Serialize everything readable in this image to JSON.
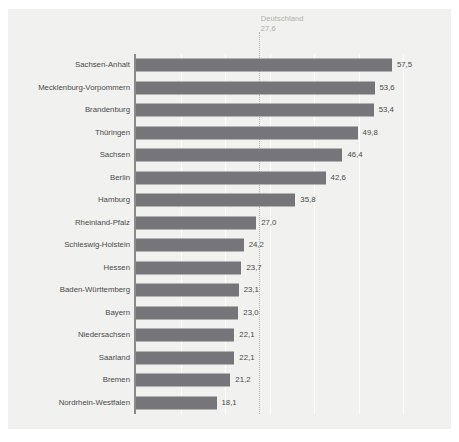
{
  "figure": {
    "top_clipped_text": "",
    "background_color": "#f1f1ef",
    "bar_color": "#76767a",
    "label_color": "#4a4a4a",
    "reference_color": "#b0b0ae"
  },
  "chart_data": {
    "type": "bar",
    "orientation": "horizontal",
    "title": "",
    "subtitle": "",
    "xlabel": "",
    "ylabel": "",
    "xlim": [
      0,
      62
    ],
    "grid": true,
    "gridlines": [
      10,
      20,
      30,
      40,
      50,
      60
    ],
    "legend": null,
    "categories": [
      "Sachsen-Anhalt",
      "Mecklenburg-Vorpommern",
      "Brandenburg",
      "Thüringen",
      "Sachsen",
      "Berlin",
      "Hamburg",
      "Rheinland-Pfalz",
      "Schleswig-Holstein",
      "Hessen",
      "Baden-Württemberg",
      "Bayern",
      "Niedersachsen",
      "Saarland",
      "Bremen",
      "Nordrhein-Westfalen"
    ],
    "values": [
      57.5,
      53.6,
      53.4,
      49.8,
      46.4,
      42.6,
      35.8,
      27.0,
      24.2,
      23.7,
      23.1,
      23.0,
      22.1,
      22.1,
      21.2,
      18.1
    ],
    "value_labels": [
      "57,5",
      "53,6",
      "53,4",
      "49,8",
      "46,4",
      "42,6",
      "35,8",
      "27,0",
      "24,2",
      "23,7",
      "23,1",
      "23,0",
      "22,1",
      "22,1",
      "21,2",
      "18,1"
    ],
    "annotations": [
      {
        "name": "Deutschland",
        "label": "Deutschland",
        "value": 27.6,
        "value_label": "27,6",
        "style": "dotted-vertical-reference-line"
      }
    ]
  }
}
